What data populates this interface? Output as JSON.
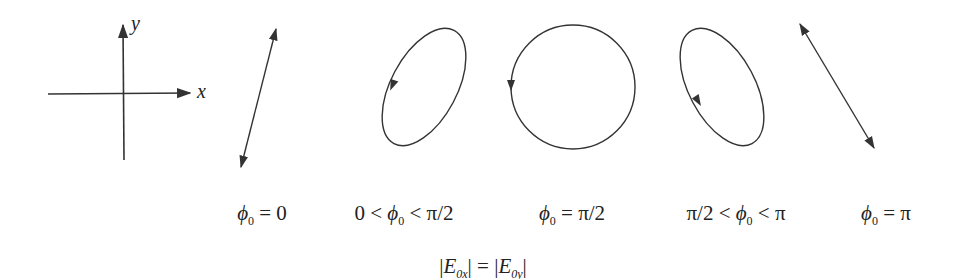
{
  "axes": {
    "x_label": "x",
    "y_label": "y"
  },
  "cases": [
    {
      "id": "phi0-zero",
      "label_pre": "",
      "label_main": "ϕ",
      "label_sub": "0",
      "label_post": " = 0",
      "shape": "line-positive-slope"
    },
    {
      "id": "phi0-between-0-and-pi-half",
      "label_pre": "0 < ",
      "label_main": "ϕ",
      "label_sub": "0",
      "label_post": " < π/2",
      "shape": "ellipse-tilted-right",
      "rotation": "counterclockwise"
    },
    {
      "id": "phi0-pi-half",
      "label_pre": "",
      "label_main": "ϕ",
      "label_sub": "0",
      "label_post": " = π/2",
      "shape": "circle",
      "rotation": "counterclockwise"
    },
    {
      "id": "phi0-between-pi-half-and-pi",
      "label_pre": "π/2 < ",
      "label_main": "ϕ",
      "label_sub": "0",
      "label_post": " < π",
      "shape": "ellipse-tilted-left",
      "rotation": "counterclockwise"
    },
    {
      "id": "phi0-pi",
      "label_pre": "",
      "label_main": "ϕ",
      "label_sub": "0",
      "label_post": " = π",
      "shape": "line-negative-slope"
    }
  ],
  "condition": {
    "left_open": "|",
    "left_main": "E",
    "left_sub": "0x",
    "middle": "| = |",
    "right_main": "E",
    "right_sub": "0y",
    "right_close": "|"
  },
  "colors": {
    "stroke": "#333333",
    "background": "#ffffff"
  }
}
